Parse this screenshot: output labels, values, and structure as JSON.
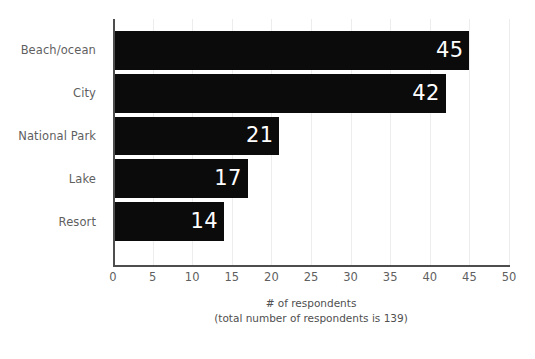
{
  "chart_data": {
    "type": "bar",
    "orientation": "horizontal",
    "title": "",
    "subtitle": "",
    "xlabel": "# of respondents",
    "xlabel_note": "(total number of respondents is 139)",
    "ylabel": "",
    "categories": [
      "Beach/ocean",
      "City",
      "National Park",
      "Lake",
      "Resort"
    ],
    "values": [
      45,
      42,
      21,
      17,
      14
    ],
    "value_labels": [
      "45",
      "42",
      "21",
      "17",
      "14"
    ],
    "xlim": [
      0,
      50
    ],
    "xticks": [
      0,
      5,
      10,
      15,
      20,
      25,
      30,
      35,
      40,
      45,
      50
    ],
    "xtick_labels": [
      "0",
      "5",
      "10",
      "15",
      "20",
      "25",
      "30",
      "35",
      "40",
      "45",
      "50"
    ],
    "grid": "vertical-only",
    "legend": "none",
    "total_respondents": 139,
    "colors": {
      "bar": "#0b0b0b",
      "value_label": "#ffffff",
      "gridline": "#ededed",
      "axis_line": "#4d4d4d",
      "tick_label": "#5f5f5f",
      "background": "#ffffff"
    }
  }
}
